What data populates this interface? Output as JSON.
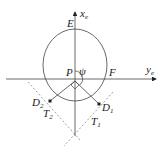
{
  "diagram": {
    "type": "geometry",
    "axes": {
      "vertical": {
        "label": "x",
        "subscript": "e"
      },
      "horizontal": {
        "label": "y",
        "subscript": "e"
      }
    },
    "points": {
      "E": {
        "label": "E"
      },
      "F": {
        "label": "F"
      },
      "P": {
        "label": "P"
      },
      "psi": {
        "label": "ψ"
      },
      "D1": {
        "label": "D",
        "subscript": "1"
      },
      "D2": {
        "label": "D",
        "subscript": "2"
      },
      "T1": {
        "label": "T",
        "subscript": "1"
      },
      "T2": {
        "label": "T",
        "subscript": "2"
      }
    },
    "colors": {
      "stroke": "#333333",
      "dashed": "#666666",
      "background": "#ffffff"
    }
  }
}
